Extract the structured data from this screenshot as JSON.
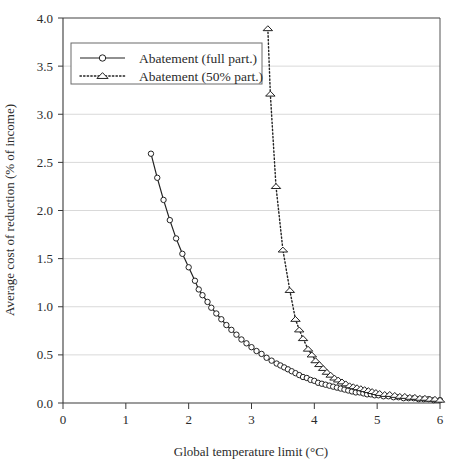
{
  "chart_data": {
    "type": "line",
    "title": "",
    "xlabel": "Global temperature limit (°C)",
    "ylabel": "Average cost of reduction (% of income)",
    "xlim": [
      0,
      6
    ],
    "ylim": [
      0,
      4.0
    ],
    "xticks": [
      0,
      1,
      2,
      3,
      4,
      5,
      6
    ],
    "xticklabels": [
      "0",
      "1",
      "2",
      "3",
      "4",
      "5",
      "6"
    ],
    "yticks": [
      0.0,
      0.5,
      1.0,
      1.5,
      2.0,
      2.5,
      3.0,
      3.5,
      4.0
    ],
    "yticklabels": [
      "0.0",
      "0.5",
      "1.0",
      "1.5",
      "2.0",
      "2.5",
      "3.0",
      "3.5",
      "4.0"
    ],
    "grid": "horizontal",
    "legend_position": "upper-left",
    "series": [
      {
        "name": "Abatement (full part.)",
        "marker": "circle",
        "linestyle": "solid",
        "color": "#222222",
        "points": [
          [
            1.4,
            2.59
          ],
          [
            1.5,
            2.34
          ],
          [
            1.6,
            2.11
          ],
          [
            1.7,
            1.9
          ],
          [
            1.8,
            1.71
          ],
          [
            1.9,
            1.55
          ],
          [
            2.0,
            1.41
          ],
          [
            2.1,
            1.27
          ],
          [
            2.16,
            1.18
          ],
          [
            2.22,
            1.12
          ],
          [
            2.3,
            1.05
          ],
          [
            2.36,
            0.99
          ],
          [
            2.44,
            0.93
          ],
          [
            2.52,
            0.87
          ],
          [
            2.6,
            0.81
          ],
          [
            2.68,
            0.76
          ],
          [
            2.76,
            0.71
          ],
          [
            2.84,
            0.66
          ],
          [
            2.92,
            0.62
          ],
          [
            3.0,
            0.58
          ],
          [
            3.08,
            0.54
          ],
          [
            3.16,
            0.51
          ],
          [
            3.24,
            0.47
          ],
          [
            3.32,
            0.44
          ],
          [
            3.4,
            0.41
          ],
          [
            3.46,
            0.39
          ],
          [
            3.52,
            0.37
          ],
          [
            3.58,
            0.35
          ],
          [
            3.64,
            0.33
          ],
          [
            3.7,
            0.31
          ],
          [
            3.76,
            0.29
          ],
          [
            3.82,
            0.27
          ],
          [
            3.88,
            0.26
          ],
          [
            3.94,
            0.24
          ],
          [
            4.0,
            0.23
          ],
          [
            4.06,
            0.21
          ],
          [
            4.12,
            0.2
          ],
          [
            4.18,
            0.19
          ],
          [
            4.24,
            0.18
          ],
          [
            4.3,
            0.17
          ],
          [
            4.36,
            0.16
          ],
          [
            4.42,
            0.15
          ],
          [
            4.48,
            0.14
          ],
          [
            4.54,
            0.13
          ],
          [
            4.6,
            0.12
          ],
          [
            4.66,
            0.11
          ],
          [
            4.72,
            0.11
          ],
          [
            4.78,
            0.1
          ],
          [
            4.84,
            0.09
          ],
          [
            4.9,
            0.09
          ],
          [
            4.96,
            0.08
          ],
          [
            5.02,
            0.08
          ],
          [
            5.1,
            0.07
          ],
          [
            5.18,
            0.07
          ],
          [
            5.26,
            0.06
          ],
          [
            5.34,
            0.06
          ],
          [
            5.42,
            0.05
          ],
          [
            5.5,
            0.05
          ],
          [
            5.58,
            0.05
          ],
          [
            5.66,
            0.04
          ],
          [
            5.74,
            0.04
          ],
          [
            5.82,
            0.04
          ],
          [
            5.9,
            0.03
          ],
          [
            6.0,
            0.03
          ]
        ]
      },
      {
        "name": "Abatement (50% part.)",
        "marker": "triangle",
        "linestyle": "dotted",
        "color": "#222222",
        "points": [
          [
            3.26,
            3.89
          ],
          [
            3.3,
            3.21
          ],
          [
            3.39,
            2.25
          ],
          [
            3.5,
            1.59
          ],
          [
            3.61,
            1.17
          ],
          [
            3.7,
            0.87
          ],
          [
            3.76,
            0.76
          ],
          [
            3.82,
            0.67
          ],
          [
            3.9,
            0.56
          ],
          [
            3.96,
            0.5
          ],
          [
            4.02,
            0.44
          ],
          [
            4.08,
            0.4
          ],
          [
            4.14,
            0.36
          ],
          [
            4.2,
            0.32
          ],
          [
            4.26,
            0.29
          ],
          [
            4.32,
            0.26
          ],
          [
            4.38,
            0.24
          ],
          [
            4.44,
            0.22
          ],
          [
            4.5,
            0.2
          ],
          [
            4.56,
            0.18
          ],
          [
            4.62,
            0.17
          ],
          [
            4.68,
            0.16
          ],
          [
            4.74,
            0.15
          ],
          [
            4.8,
            0.14
          ],
          [
            4.86,
            0.13
          ],
          [
            4.92,
            0.12
          ],
          [
            4.98,
            0.11
          ],
          [
            5.04,
            0.1
          ],
          [
            5.12,
            0.09
          ],
          [
            5.2,
            0.09
          ],
          [
            5.28,
            0.08
          ],
          [
            5.36,
            0.07
          ],
          [
            5.44,
            0.07
          ],
          [
            5.52,
            0.06
          ],
          [
            5.6,
            0.06
          ],
          [
            5.68,
            0.05
          ],
          [
            5.76,
            0.05
          ],
          [
            5.84,
            0.04
          ],
          [
            5.92,
            0.04
          ],
          [
            6.0,
            0.03
          ]
        ]
      }
    ]
  },
  "legend": {
    "items": [
      {
        "label": "Abatement (full part.)",
        "marker": "circle",
        "linestyle": "solid"
      },
      {
        "label": "Abatement (50% part.)",
        "marker": "triangle",
        "linestyle": "dotted"
      }
    ]
  },
  "colors": {
    "axis": "#3a3a3a",
    "grid": "#d9d9d9",
    "series": "#222222",
    "text": "#2b2b2b",
    "background": "#ffffff"
  }
}
